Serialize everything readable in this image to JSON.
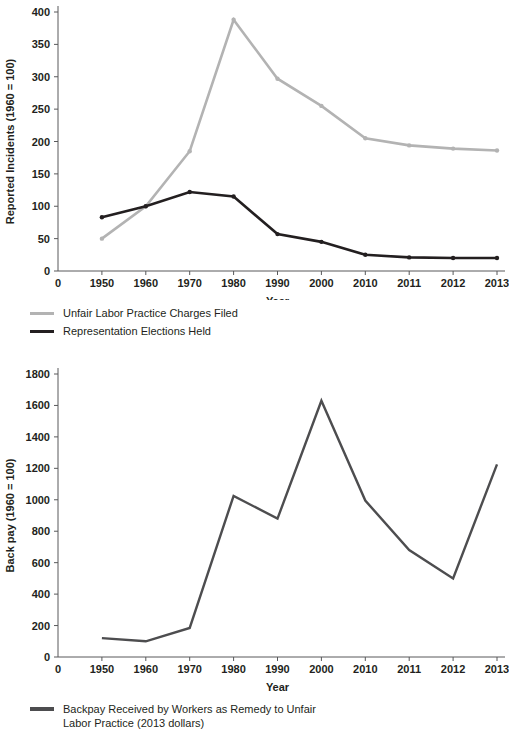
{
  "chart_data": [
    {
      "id": "top",
      "type": "line",
      "title": "",
      "xlabel": "Year",
      "ylabel": "Reported Incidents (1960 = 100)",
      "categories": [
        "0",
        "1950",
        "1960",
        "1970",
        "1980",
        "1990",
        "2000",
        "2010",
        "2011",
        "2012",
        "2013"
      ],
      "data_categories": [
        "1950",
        "1960",
        "1970",
        "1980",
        "1990",
        "2000",
        "2010",
        "2011",
        "2012",
        "2013"
      ],
      "ylim": [
        0,
        400
      ],
      "yticks": [
        "0",
        "50",
        "100",
        "150",
        "200",
        "250",
        "300",
        "350",
        "400"
      ],
      "ytick_values": [
        0,
        50,
        100,
        150,
        200,
        250,
        300,
        350,
        400
      ],
      "grid": false,
      "legend_position": "below",
      "series": [
        {
          "name": "Unfair Labor Practice Charges Filed",
          "color": "#b3b3b3",
          "markers": true,
          "values": [
            50,
            100,
            185,
            388,
            297,
            255,
            205,
            194,
            189,
            186
          ]
        },
        {
          "name": "Representation Elections Held",
          "color": "#231f20",
          "markers": true,
          "values": [
            83,
            100,
            122,
            115,
            57,
            45,
            25,
            21,
            20,
            20
          ]
        }
      ]
    },
    {
      "id": "bottom",
      "type": "line",
      "title": "",
      "xlabel": "Year",
      "ylabel": "Back pay (1960 = 100)",
      "categories": [
        "0",
        "1950",
        "1960",
        "1970",
        "1980",
        "1990",
        "2000",
        "2010",
        "2011",
        "2012",
        "2013"
      ],
      "data_categories": [
        "1950",
        "1960",
        "1970",
        "1980",
        "1990",
        "2000",
        "2010",
        "2011",
        "2012",
        "2013"
      ],
      "ylim": [
        0,
        1800
      ],
      "yticks": [
        "0",
        "200",
        "400",
        "600",
        "800",
        "1000",
        "1200",
        "1400",
        "1600",
        "1800"
      ],
      "ytick_values": [
        0,
        200,
        400,
        600,
        800,
        1000,
        1200,
        1400,
        1600,
        1800
      ],
      "grid": false,
      "legend_position": "below",
      "series": [
        {
          "name": "Backpay Received by Workers as Remedy to Unfair\nLabor Practice (2013 dollars)",
          "color": "#4d4d4f",
          "markers": false,
          "values": [
            120,
            100,
            185,
            1025,
            880,
            1630,
            995,
            680,
            500,
            1225
          ]
        }
      ]
    }
  ],
  "legends": {
    "top": [
      {
        "label": "Unfair Labor Practice Charges Filed",
        "color": "#b3b3b3"
      },
      {
        "label": "Representation Elections Held",
        "color": "#231f20"
      }
    ],
    "bottom": [
      {
        "label": "Backpay Received by Workers as Remedy to Unfair\nLabor Practice (2013 dollars)",
        "color": "#4d4d4f"
      }
    ]
  }
}
